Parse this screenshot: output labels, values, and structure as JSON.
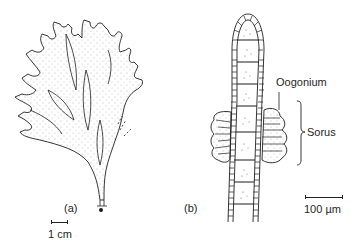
{
  "figure": {
    "panels": [
      {
        "id": "a",
        "label": "(a)",
        "subject": "branched thallus",
        "scale_bar": "1 cm"
      },
      {
        "id": "b",
        "label": "(b)",
        "subject": "filament with sori",
        "scale_bar": "100 µm"
      }
    ],
    "annotations": {
      "oogonium": "Oogonium",
      "sorus": "Sorus"
    },
    "colors": {
      "ink": "#1f1f1f",
      "stipple": "#6b6b6b",
      "background": "#ffffff"
    }
  }
}
